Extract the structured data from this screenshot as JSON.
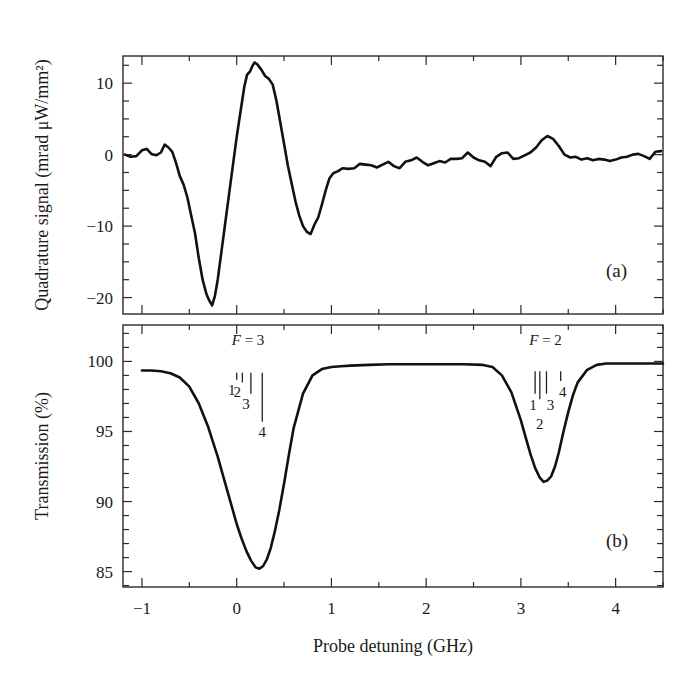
{
  "chart_data": [
    {
      "id": "panel-a",
      "type": "line",
      "panel_label": "(a)",
      "title": "",
      "xlabel": "Probe detuning (GHz)",
      "ylabel": "Quadrature signal (mrad μW/mm²)",
      "xlim": [
        -1.2,
        4.5
      ],
      "ylim": [
        -22.3,
        13.8
      ],
      "xticks": [
        -1,
        0,
        1,
        2,
        3,
        4
      ],
      "xtick_labels": [
        "−1",
        "0",
        "1",
        "2",
        "3",
        "4"
      ],
      "x_minor_step": 0.5,
      "yticks": [
        10,
        0,
        -10,
        -20
      ],
      "ytick_labels": [
        "10",
        "0",
        "−10",
        "−20"
      ],
      "y_minor_step": 2.5,
      "grid": false,
      "series": [
        {
          "name": "Quadrature signal",
          "x": [
            -1.18,
            -1.12,
            -1.06,
            -1.0,
            -0.95,
            -0.9,
            -0.85,
            -0.8,
            -0.76,
            -0.72,
            -0.68,
            -0.64,
            -0.6,
            -0.56,
            -0.52,
            -0.48,
            -0.44,
            -0.4,
            -0.36,
            -0.32,
            -0.29,
            -0.26,
            -0.23,
            -0.2,
            -0.16,
            -0.12,
            -0.08,
            -0.04,
            0.0,
            0.04,
            0.08,
            0.11,
            0.14,
            0.17,
            0.19,
            0.22,
            0.26,
            0.3,
            0.34,
            0.38,
            0.42,
            0.46,
            0.5,
            0.54,
            0.58,
            0.62,
            0.66,
            0.7,
            0.74,
            0.78,
            0.82,
            0.86,
            0.9,
            0.94,
            0.98,
            1.02,
            1.07,
            1.12,
            1.18,
            1.24,
            1.3,
            1.36,
            1.42,
            1.48,
            1.54,
            1.6,
            1.66,
            1.72,
            1.78,
            1.84,
            1.9,
            1.96,
            2.02,
            2.08,
            2.14,
            2.2,
            2.26,
            2.32,
            2.38,
            2.44,
            2.5,
            2.56,
            2.62,
            2.68,
            2.74,
            2.8,
            2.86,
            2.92,
            2.98,
            3.04,
            3.1,
            3.16,
            3.22,
            3.28,
            3.34,
            3.4,
            3.46,
            3.52,
            3.58,
            3.64,
            3.7,
            3.76,
            3.82,
            3.88,
            3.94,
            4.0,
            4.06,
            4.12,
            4.18,
            4.24,
            4.3,
            4.36,
            4.42,
            4.48
          ],
          "y": [
            0.0,
            -0.3,
            -0.2,
            0.6,
            0.8,
            0.1,
            -0.1,
            0.3,
            1.4,
            1.0,
            0.4,
            -1.2,
            -3.0,
            -4.2,
            -6.0,
            -8.5,
            -11.0,
            -14.5,
            -17.5,
            -19.5,
            -20.4,
            -21.1,
            -19.8,
            -17.5,
            -13.5,
            -9.5,
            -5.5,
            -1.5,
            2.5,
            6.0,
            9.5,
            11.2,
            11.6,
            12.5,
            12.9,
            12.6,
            11.9,
            11.0,
            10.6,
            9.8,
            7.5,
            4.5,
            1.5,
            -1.5,
            -4.0,
            -6.5,
            -8.5,
            -10.0,
            -10.8,
            -11.1,
            -9.8,
            -8.8,
            -7.0,
            -5.0,
            -3.3,
            -2.6,
            -2.3,
            -1.9,
            -2.0,
            -1.9,
            -1.3,
            -1.4,
            -1.5,
            -1.8,
            -1.4,
            -1.0,
            -1.6,
            -1.9,
            -1.0,
            -0.8,
            -0.4,
            -1.0,
            -1.5,
            -1.2,
            -0.9,
            -1.1,
            -0.6,
            -0.6,
            -0.5,
            0.3,
            -0.4,
            -0.8,
            -1.0,
            -1.6,
            -0.3,
            0.2,
            0.3,
            -0.6,
            -0.5,
            -0.1,
            0.3,
            1.0,
            2.0,
            2.6,
            2.2,
            1.2,
            0.0,
            -0.4,
            -0.3,
            -0.7,
            -0.5,
            -0.8,
            -0.6,
            -0.7,
            -0.9,
            -0.7,
            -0.4,
            -0.3,
            0.0,
            0.1,
            -0.2,
            -0.6,
            0.4,
            0.5
          ]
        }
      ]
    },
    {
      "id": "panel-b",
      "type": "line",
      "panel_label": "(b)",
      "title": "",
      "xlabel": "Probe detuning (GHz)",
      "ylabel": "Transmission (%)",
      "xlim": [
        -1.2,
        4.5
      ],
      "ylim": [
        83.9,
        102.6
      ],
      "xticks": [
        -1,
        0,
        1,
        2,
        3,
        4
      ],
      "xtick_labels": [
        "−1",
        "0",
        "1",
        "2",
        "3",
        "4"
      ],
      "x_minor_step": 0.5,
      "yticks": [
        100,
        95,
        90,
        85
      ],
      "ytick_labels": [
        "100",
        "95",
        "90",
        "85"
      ],
      "y_minor_step": 1,
      "grid": false,
      "series": [
        {
          "name": "Transmission",
          "x": [
            -1.0,
            -0.9,
            -0.8,
            -0.7,
            -0.6,
            -0.5,
            -0.4,
            -0.3,
            -0.2,
            -0.1,
            0.0,
            0.05,
            0.1,
            0.15,
            0.2,
            0.24,
            0.28,
            0.32,
            0.36,
            0.4,
            0.45,
            0.5,
            0.55,
            0.6,
            0.7,
            0.8,
            0.9,
            1.0,
            1.1,
            1.2,
            1.4,
            1.6,
            1.8,
            2.0,
            2.2,
            2.4,
            2.6,
            2.7,
            2.8,
            2.9,
            3.0,
            3.05,
            3.1,
            3.15,
            3.2,
            3.24,
            3.28,
            3.32,
            3.36,
            3.4,
            3.45,
            3.5,
            3.55,
            3.6,
            3.7,
            3.8,
            3.9,
            4.0,
            4.2,
            4.4,
            4.5
          ],
          "y": [
            99.35,
            99.35,
            99.3,
            99.15,
            98.85,
            98.2,
            97.0,
            95.3,
            93.2,
            90.8,
            88.4,
            87.4,
            86.5,
            85.8,
            85.3,
            85.2,
            85.4,
            85.9,
            86.7,
            87.8,
            89.4,
            91.3,
            93.3,
            95.2,
            97.7,
            99.0,
            99.45,
            99.6,
            99.65,
            99.7,
            99.75,
            99.8,
            99.8,
            99.8,
            99.8,
            99.8,
            99.75,
            99.6,
            99.0,
            97.8,
            95.8,
            94.6,
            93.4,
            92.4,
            91.7,
            91.4,
            91.5,
            91.8,
            92.5,
            93.5,
            95.0,
            96.4,
            97.6,
            98.5,
            99.4,
            99.75,
            99.85,
            99.85,
            99.85,
            99.85,
            99.85
          ]
        }
      ],
      "annotations": [
        {
          "group": "F = 3",
          "italic_symbol": "F",
          "equals": " = ",
          "value": "3",
          "lines": [
            {
              "label": "1",
              "x": 0.0,
              "top": 99.2,
              "bottom": 98.7
            },
            {
              "label": "2",
              "x": 0.06,
              "top": 99.2,
              "bottom": 98.5
            },
            {
              "label": "3",
              "x": 0.15,
              "top": 99.2,
              "bottom": 97.7
            },
            {
              "label": "4",
              "x": 0.27,
              "top": 99.2,
              "bottom": 95.7
            }
          ]
        },
        {
          "group": "F = 2",
          "italic_symbol": "F",
          "equals": " = ",
          "value": "2",
          "lines": [
            {
              "label": "1",
              "x": 3.15,
              "top": 99.3,
              "bottom": 97.7
            },
            {
              "label": "2",
              "x": 3.2,
              "top": 99.3,
              "bottom": 97.3
            },
            {
              "label": "3",
              "x": 3.27,
              "top": 99.3,
              "bottom": 97.7
            },
            {
              "label": "4",
              "x": 3.42,
              "top": 99.3,
              "bottom": 98.6
            }
          ]
        }
      ]
    }
  ]
}
